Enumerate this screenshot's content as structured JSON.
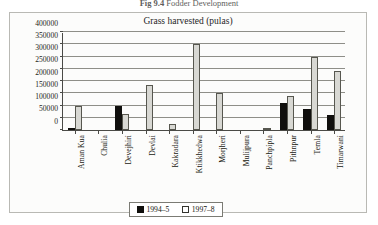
{
  "figure": {
    "number": "Fig 9.4",
    "caption": "Fodder Development"
  },
  "chart": {
    "title": "Grass harvested (pulas)"
  },
  "legend": {
    "items": [
      {
        "label": "1994–5",
        "color": "#100f0d",
        "name": "series-1994-5"
      },
      {
        "label": "1997–8",
        "color": "#ffffff",
        "name": "series-1997-8"
      }
    ]
  },
  "chart_data": {
    "type": "bar",
    "title": "Grass harvested (pulas)",
    "xlabel": "",
    "ylabel": "",
    "ylim": [
      0,
      400000
    ],
    "ytick_step": 50000,
    "yticks": [
      0,
      50000,
      100000,
      150000,
      200000,
      250000,
      300000,
      350000,
      400000
    ],
    "ytick_labels": [
      "0",
      "50000",
      "100000",
      "150000",
      "200000",
      "250000",
      "300000",
      "350000",
      "400000"
    ],
    "grid": true,
    "legend_position": "bottom",
    "categories": [
      "Aman Kua",
      "Chulia",
      "Devejhiri",
      "Devlai",
      "Kakradara",
      "Ktikkhedwa",
      "Morjheri",
      "Mulijpura",
      "Panchpipla",
      "Pithnpur",
      "Temla",
      "Timarwani"
    ],
    "series": [
      {
        "name": "1994–5",
        "color": "#100f0d",
        "values": [
          10000,
          0,
          100000,
          0,
          0,
          0,
          0,
          0,
          0,
          110000,
          85000,
          60000
        ]
      },
      {
        "name": "1997–8",
        "color": "#d8d8d3",
        "values": [
          100000,
          0,
          65000,
          185000,
          25000,
          350000,
          150000,
          0,
          10000,
          140000,
          300000,
          240000
        ]
      }
    ]
  }
}
